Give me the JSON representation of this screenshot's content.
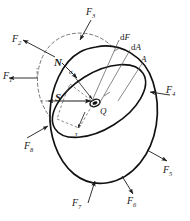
{
  "figure": {
    "colors": {
      "outline": "#111111",
      "dashed": "#555555",
      "arrow": "#1a1a1a",
      "background": "#ffffff",
      "section_fill": "#ffffff"
    },
    "force_labels": [
      {
        "name": "F1",
        "base": "F",
        "sub": "1",
        "x": 3,
        "y": 71
      },
      {
        "name": "F2",
        "base": "F",
        "sub": "2",
        "x": 12,
        "y": 34
      },
      {
        "name": "F3",
        "base": "F",
        "sub": "3",
        "x": 86,
        "y": 7
      },
      {
        "name": "F4",
        "base": "F",
        "sub": "4",
        "x": 166,
        "y": 85
      },
      {
        "name": "F5",
        "base": "F",
        "sub": "5",
        "x": 163,
        "y": 165
      },
      {
        "name": "F6",
        "base": "F",
        "sub": "6",
        "x": 127,
        "y": 196
      },
      {
        "name": "F7",
        "base": "F",
        "sub": "7",
        "x": 72,
        "y": 198
      },
      {
        "name": "F8",
        "base": "F",
        "sub": "8",
        "x": 24,
        "y": 141
      }
    ],
    "vector_labels": [
      {
        "name": "N",
        "text": "N",
        "x": 54,
        "y": 57
      },
      {
        "name": "S",
        "text": "S",
        "x": 55,
        "y": 92
      }
    ],
    "greek_labels": [
      {
        "name": "sigma",
        "text": "σ",
        "x": 69,
        "y": 69
      },
      {
        "name": "tau",
        "text": "τ",
        "x": 75,
        "y": 131
      }
    ],
    "point_labels": [
      {
        "name": "Q",
        "text": "Q",
        "x": 100,
        "y": 107
      },
      {
        "name": "A",
        "text": "A",
        "x": 141,
        "y": 55
      }
    ],
    "differential_labels": [
      {
        "name": "dF",
        "prefix": "d",
        "italic": "F",
        "x": 120,
        "y": 33
      },
      {
        "name": "dA",
        "prefix": "d",
        "italic": "A",
        "x": 131,
        "y": 43
      }
    ]
  }
}
